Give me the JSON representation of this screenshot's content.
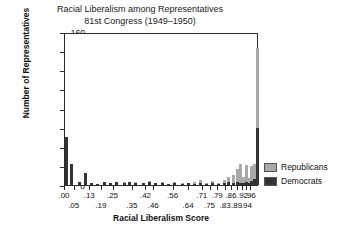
{
  "chart_data": {
    "type": "bar",
    "title": "Racial Liberalism among Representatives",
    "subtitle": "81st Congress (1949–1950)",
    "xlabel": "Racial Liberalism Score",
    "ylabel": "Number of Representatives",
    "ylim": [
      0,
      160
    ],
    "yticks": [
      0,
      20,
      40,
      60,
      80,
      100,
      120,
      140,
      160
    ],
    "grid": false,
    "stacked": true,
    "legend_position": "right",
    "legend": [
      {
        "name": "Republicans",
        "color": "#a9a9a9"
      },
      {
        "name": "Democrats",
        "color": "#333333"
      }
    ],
    "xtick_labels_row1": [
      ".00",
      ".13",
      ".25",
      ".42",
      ".56",
      ".71",
      ".79",
      ".86",
      ".92",
      ".96"
    ],
    "xtick_labels_row2": [
      ".05",
      ".19",
      ".35",
      ".46",
      ".64",
      ".75",
      ".83",
      ".89",
      ".94"
    ],
    "xtick_positions_row1": [
      0.0,
      0.13,
      0.25,
      0.42,
      0.56,
      0.71,
      0.79,
      0.86,
      0.92,
      0.96
    ],
    "xtick_positions_row2": [
      0.05,
      0.19,
      0.35,
      0.46,
      0.64,
      0.75,
      0.83,
      0.89,
      0.94
    ],
    "series": [
      {
        "name": "Democrats",
        "color": "#333333"
      },
      {
        "name": "Republicans",
        "color": "#a9a9a9"
      }
    ],
    "bars": [
      {
        "x": 0.005,
        "dem": 50,
        "rep": 0
      },
      {
        "x": 0.035,
        "dem": 22,
        "rep": 0
      },
      {
        "x": 0.075,
        "dem": 3,
        "rep": 0
      },
      {
        "x": 0.105,
        "dem": 13,
        "rep": 0
      },
      {
        "x": 0.135,
        "dem": 2,
        "rep": 0
      },
      {
        "x": 0.165,
        "dem": 1,
        "rep": 0
      },
      {
        "x": 0.205,
        "dem": 3,
        "rep": 0
      },
      {
        "x": 0.235,
        "dem": 2,
        "rep": 0
      },
      {
        "x": 0.265,
        "dem": 3,
        "rep": 0
      },
      {
        "x": 0.305,
        "dem": 2,
        "rep": 1
      },
      {
        "x": 0.335,
        "dem": 3,
        "rep": 0
      },
      {
        "x": 0.365,
        "dem": 2,
        "rep": 1
      },
      {
        "x": 0.405,
        "dem": 2,
        "rep": 0
      },
      {
        "x": 0.435,
        "dem": 3,
        "rep": 1
      },
      {
        "x": 0.465,
        "dem": 2,
        "rep": 0
      },
      {
        "x": 0.505,
        "dem": 2,
        "rep": 1
      },
      {
        "x": 0.535,
        "dem": 1,
        "rep": 0
      },
      {
        "x": 0.565,
        "dem": 2,
        "rep": 1
      },
      {
        "x": 0.605,
        "dem": 1,
        "rep": 1
      },
      {
        "x": 0.635,
        "dem": 2,
        "rep": 0
      },
      {
        "x": 0.665,
        "dem": 1,
        "rep": 2
      },
      {
        "x": 0.7,
        "dem": 2,
        "rep": 3
      },
      {
        "x": 0.73,
        "dem": 1,
        "rep": 1
      },
      {
        "x": 0.76,
        "dem": 2,
        "rep": 2
      },
      {
        "x": 0.79,
        "dem": 1,
        "rep": 1
      },
      {
        "x": 0.82,
        "dem": 2,
        "rep": 3
      },
      {
        "x": 0.845,
        "dem": 3,
        "rep": 5
      },
      {
        "x": 0.87,
        "dem": 2,
        "rep": 8
      },
      {
        "x": 0.89,
        "dem": 3,
        "rep": 14
      },
      {
        "x": 0.905,
        "dem": 2,
        "rep": 20
      },
      {
        "x": 0.92,
        "dem": 2,
        "rep": 6
      },
      {
        "x": 0.935,
        "dem": 3,
        "rep": 18
      },
      {
        "x": 0.95,
        "dem": 2,
        "rep": 5
      },
      {
        "x": 0.962,
        "dem": 4,
        "rep": 16
      },
      {
        "x": 0.975,
        "dem": 6,
        "rep": 16
      },
      {
        "x": 0.99,
        "dem": 60,
        "rep": 83
      }
    ]
  }
}
